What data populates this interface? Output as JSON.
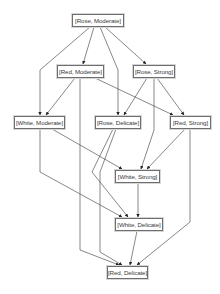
{
  "diagram": {
    "type": "hasse-lattice",
    "line_color": "#555555",
    "node_border_color": "#6e6e6e",
    "nodes": [
      {
        "id": "rose_moderate",
        "label": "[Rose, Moderate]",
        "x": 72,
        "y": 14,
        "w": 52
      },
      {
        "id": "red_moderate",
        "label": "[Red, Moderate]",
        "x": 57,
        "y": 65,
        "w": 47
      },
      {
        "id": "rose_strong",
        "label": "[Rose, Strong]",
        "x": 133,
        "y": 65,
        "w": 42
      },
      {
        "id": "white_moderate",
        "label": "[White, Moderate]",
        "x": 14,
        "y": 116,
        "w": 51
      },
      {
        "id": "rose_delicate",
        "label": "[Rose, Delicate]",
        "x": 95,
        "y": 116,
        "w": 46
      },
      {
        "id": "red_strong",
        "label": "[Red, Strong]",
        "x": 170,
        "y": 116,
        "w": 41
      },
      {
        "id": "white_strong",
        "label": "[White, Strong]",
        "x": 115,
        "y": 170,
        "w": 45
      },
      {
        "id": "white_delicate",
        "label": "[White, Delicate]",
        "x": 115,
        "y": 218,
        "w": 48
      },
      {
        "id": "red_delicate",
        "label": "[Red, Delicate]",
        "x": 107,
        "y": 266,
        "w": 41
      }
    ],
    "edges": [
      {
        "from": "rose_moderate",
        "to": "white_moderate",
        "points": "90,27 40,70 40,115"
      },
      {
        "from": "rose_moderate",
        "to": "red_moderate",
        "points": "94,27 83,64"
      },
      {
        "from": "rose_moderate",
        "to": "rose_delicate",
        "points": "100,27 118,70 118,115"
      },
      {
        "from": "rose_moderate",
        "to": "rose_strong",
        "points": "105,27 146,64"
      },
      {
        "from": "red_moderate",
        "to": "white_moderate",
        "points": "75,78 46,115"
      },
      {
        "from": "red_moderate",
        "to": "red_delicate",
        "points": "80,78 80,250 119,265"
      },
      {
        "from": "red_moderate",
        "to": "red_strong",
        "points": "95,78 173,115"
      },
      {
        "from": "rose_strong",
        "to": "rose_delicate",
        "points": "147,78 124,115"
      },
      {
        "from": "rose_strong",
        "to": "white_strong",
        "points": "154,78 154,130 141,169"
      },
      {
        "from": "rose_strong",
        "to": "red_strong",
        "points": "157,78 184,115"
      },
      {
        "from": "white_moderate",
        "to": "white_strong",
        "points": "52,129 122,169"
      },
      {
        "from": "white_moderate",
        "to": "white_delicate",
        "points": "40,129 40,172 122,217"
      },
      {
        "from": "rose_delicate",
        "to": "white_delicate",
        "points": "113,129 92,172 128,217"
      },
      {
        "from": "rose_delicate",
        "to": "red_delicate",
        "points": "116,129 100,172 100,252 122,265"
      },
      {
        "from": "red_strong",
        "to": "white_strong",
        "points": "185,129 147,169"
      },
      {
        "from": "red_strong",
        "to": "red_delicate",
        "points": "190,129 190,222 137,265"
      },
      {
        "from": "white_strong",
        "to": "white_delicate",
        "points": "138,183 138,217"
      },
      {
        "from": "white_delicate",
        "to": "red_delicate",
        "points": "137,231 130,265"
      }
    ]
  }
}
